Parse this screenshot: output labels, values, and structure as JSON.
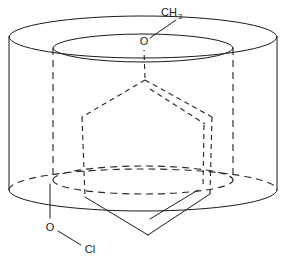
{
  "diagram": {
    "type": "chemical-structure",
    "background_color": "#ffffff",
    "line_color": "#1a1a1a",
    "labels": {
      "methyl": "CH",
      "methyl_subscript": "3",
      "oxygen_top": "O",
      "oxygen_bottom": "O",
      "chlorine": "Cl"
    },
    "host": {
      "name": "cyclodextrin-torus",
      "outer_cylinder": {
        "top_ellipse_center_x": 143,
        "top_ellipse_center_y": 37,
        "top_ellipse_rx": 134,
        "top_ellipse_ry": 21,
        "bottom_ellipse_center_x": 143,
        "bottom_ellipse_center_y": 190,
        "bottom_ellipse_rx": 134,
        "bottom_ellipse_ry": 21,
        "left_wall_x": 9,
        "right_wall_x": 277
      },
      "inner_cylinder": {
        "top_ellipse_center_x": 143,
        "top_ellipse_center_y": 48,
        "top_ellipse_rx": 90,
        "top_ellipse_ry": 14,
        "bottom_ellipse_center_x": 143,
        "bottom_ellipse_center_y": 180,
        "bottom_ellipse_rx": 90,
        "bottom_ellipse_ry": 14,
        "left_wall_x": 53,
        "right_wall_x": 233
      }
    },
    "guest": {
      "name": "benzene-ring",
      "hexagon_vertices": [
        {
          "x": 145,
          "y": 80,
          "label": "C1-top"
        },
        {
          "x": 82,
          "y": 117,
          "label": "C2-upper-left"
        },
        {
          "x": 85,
          "y": 197,
          "label": "C3-lower-left"
        },
        {
          "x": 148,
          "y": 235,
          "label": "C4-bottom"
        },
        {
          "x": 210,
          "y": 194,
          "label": "C5-lower-right"
        },
        {
          "x": 212,
          "y": 117,
          "label": "C6-upper-right"
        }
      ],
      "aromatic_double_bonds": 3,
      "substituents": [
        {
          "position": "C1-top",
          "group": "O-CH3",
          "bond_style": "dashed"
        },
        {
          "position": "C3-lower-left",
          "group": "O-Cl",
          "bond_style": "solid"
        }
      ]
    },
    "annotation_lines": [
      {
        "from": "CH3-label",
        "to": "O-top-label",
        "style": "solid"
      },
      {
        "from": "O-bottom-label",
        "to": "Cl-label",
        "style": "solid"
      }
    ]
  }
}
